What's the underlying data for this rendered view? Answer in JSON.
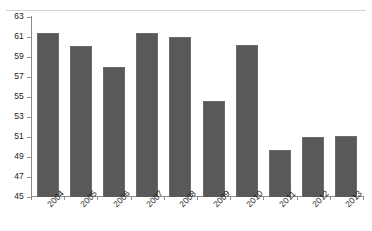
{
  "chart_data": {
    "type": "bar",
    "title": "",
    "subtitle": "",
    "xlabel": "",
    "ylabel": "",
    "categories": [
      "2004",
      "2005",
      "2006",
      "2007",
      "2008",
      "2009",
      "2010",
      "2011",
      "2012",
      "2013"
    ],
    "values": [
      61.4,
      60.1,
      58.0,
      61.4,
      61.0,
      54.6,
      60.2,
      49.7,
      51.0,
      51.1
    ],
    "series": [
      {
        "name": "",
        "values": [
          61.4,
          60.1,
          58.0,
          61.4,
          61.0,
          54.6,
          60.2,
          49.7,
          51.0,
          51.1
        ]
      }
    ],
    "ylim": [
      45,
      63
    ],
    "yticks": [
      45,
      47,
      49,
      51,
      53,
      55,
      57,
      59,
      61,
      63
    ],
    "ytick_labels": [
      "45",
      "47",
      "49",
      "51",
      "53",
      "55",
      "57",
      "59",
      "61",
      "63"
    ],
    "grid": false,
    "legend": null,
    "legend_position": "none",
    "annotations": [],
    "bar_color": "#595959",
    "bar_edge_color": "#6b6b6b",
    "axis_color": "#8c8c8c",
    "background_color": "#ffffff",
    "text_color": "#1a1a1a",
    "xlabel_rotation_degrees": -45
  }
}
